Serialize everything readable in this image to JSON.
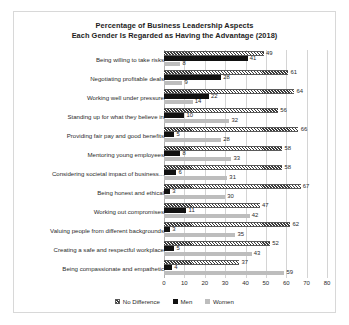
{
  "chart_data": {
    "type": "bar",
    "orientation": "horizontal",
    "title": "Percentage of Business Leadership Aspects Each Gender Is Regarded as Having the Advantage (2018)",
    "title_line1": "Percentage of Business Leadership Aspects",
    "title_line2": "Each Gender Is Regarded as Having the Advantage (2018)",
    "xlabel": "",
    "ylabel": "",
    "xlim": [
      0,
      80
    ],
    "xticks": [
      0,
      10,
      20,
      30,
      40,
      50,
      60,
      70,
      80
    ],
    "grid": true,
    "legend_position": "bottom",
    "categories": [
      "Being willing to take risks",
      "Negotiating profitable deals",
      "Working well under pressure",
      "Standing up for what they believe in",
      "Providing fair pay and good benefits",
      "Mentoring young employees",
      "Considering societal impact of business...",
      "Being honest and ethical",
      "Working out compromises",
      "Valuing people from different backgrounds",
      "Creating a safe and respectful workplace",
      "Being compassionate and empathetic"
    ],
    "series": [
      {
        "name": "No Difference",
        "color": "#3a3a3a",
        "pattern": "hatched",
        "values": [
          49,
          61,
          64,
          56,
          66,
          58,
          58,
          67,
          47,
          62,
          52,
          37
        ]
      },
      {
        "name": "Men",
        "color": "#111111",
        "pattern": "solid",
        "values": [
          41,
          28,
          22,
          10,
          5,
          8,
          6,
          3,
          11,
          3,
          5,
          4
        ]
      },
      {
        "name": "Women",
        "color": "#bdbdbd",
        "pattern": "solid",
        "values": [
          8,
          9,
          14,
          32,
          28,
          33,
          31,
          30,
          42,
          35,
          43,
          59
        ]
      }
    ]
  }
}
